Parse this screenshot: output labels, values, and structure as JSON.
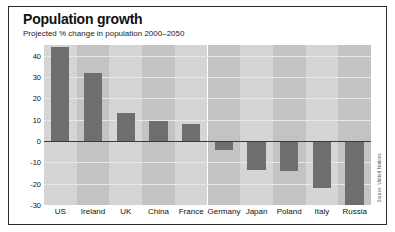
{
  "chart_data": {
    "type": "bar",
    "title": "Population growth",
    "subtitle": "Projected % change in population 2000–2050",
    "xlabel": "",
    "ylabel": "",
    "ylim": [
      -30,
      45
    ],
    "yticks": [
      40,
      30,
      20,
      10,
      0,
      -10,
      -20,
      -30
    ],
    "ytick_labels": [
      "40",
      "30",
      "20",
      "10",
      "0",
      "-10",
      "-20",
      "-30"
    ],
    "grid": true,
    "legend": "none",
    "categories": [
      "US",
      "Ireland",
      "UK",
      "China",
      "France",
      "Germany",
      "Japan",
      "Poland",
      "Italy",
      "Russia"
    ],
    "values": [
      44,
      32,
      13,
      9.5,
      8,
      -4,
      -13.5,
      -14,
      -22,
      -30
    ],
    "bar_color": "#6e6e6e",
    "band_colors": [
      "#d5d5d5",
      "#c3c3c3"
    ],
    "zero_line_color": "#3a3a3a",
    "gridline_color": "#e8e8e8",
    "source": "Source: United Nations"
  },
  "frame": {
    "border_color": "#2b2b2b",
    "background": "#ffffff"
  }
}
